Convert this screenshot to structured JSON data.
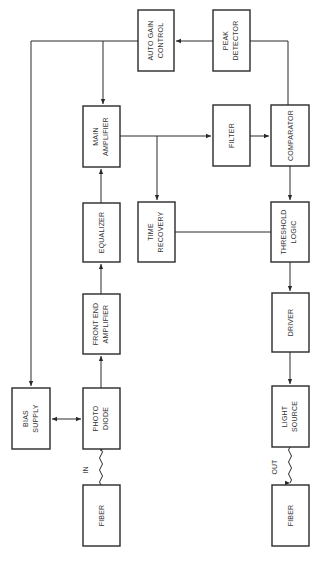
{
  "diagram": {
    "orientation": "rotated-90-ccw",
    "blocks": [
      {
        "id": "fiber_in",
        "lines": [
          "FIBER"
        ]
      },
      {
        "id": "photodiode",
        "lines": [
          "PHOTO",
          "DIODE"
        ]
      },
      {
        "id": "bias_supply",
        "lines": [
          "BIAS",
          "SUPPLY"
        ]
      },
      {
        "id": "front_end_amplifier",
        "lines": [
          "FRONT END",
          "AMPLIFIER"
        ]
      },
      {
        "id": "equalizer",
        "lines": [
          "EQUALIZER"
        ]
      },
      {
        "id": "main_amplifier",
        "lines": [
          "MAIN",
          "AMPLIFIER"
        ]
      },
      {
        "id": "auto_gain_control",
        "lines": [
          "AUTO GAIN",
          "CONTROL"
        ]
      },
      {
        "id": "time_recovery",
        "lines": [
          "TIME",
          "RECOVERY"
        ]
      },
      {
        "id": "filter",
        "lines": [
          "FILTER"
        ]
      },
      {
        "id": "peak_detector",
        "lines": [
          "PEAK",
          "DETECTOR"
        ]
      },
      {
        "id": "comparator",
        "lines": [
          "COMPARATOR"
        ]
      },
      {
        "id": "threshold_logic",
        "lines": [
          "THRESHOLD",
          "LOGIC"
        ]
      },
      {
        "id": "driver",
        "lines": [
          "DRIVER"
        ]
      },
      {
        "id": "light_source",
        "lines": [
          "LIGHT",
          "SOURCE"
        ]
      },
      {
        "id": "fiber_out",
        "lines": [
          "FIBER"
        ]
      }
    ],
    "io_labels": {
      "in": "IN",
      "out": "OUT"
    },
    "connections": [
      {
        "from": "fiber_in",
        "to": "photodiode",
        "style": "wavy",
        "label": "IN"
      },
      {
        "from": "bias_supply",
        "to": "photodiode",
        "style": "bidirectional"
      },
      {
        "from": "photodiode",
        "to": "front_end_amplifier"
      },
      {
        "from": "front_end_amplifier",
        "to": "equalizer"
      },
      {
        "from": "equalizer",
        "to": "main_amplifier"
      },
      {
        "from": "main_amplifier",
        "to": "filter"
      },
      {
        "from": "main_amplifier",
        "to": "time_recovery"
      },
      {
        "from": "filter",
        "to": "comparator"
      },
      {
        "from": "comparator",
        "to": "peak_detector"
      },
      {
        "from": "peak_detector",
        "to": "auto_gain_control"
      },
      {
        "from": "auto_gain_control",
        "to": "main_amplifier"
      },
      {
        "from": "auto_gain_control",
        "to": "bias_supply"
      },
      {
        "from": "comparator",
        "to": "threshold_logic"
      },
      {
        "from": "time_recovery",
        "to": "threshold_logic"
      },
      {
        "from": "threshold_logic",
        "to": "driver"
      },
      {
        "from": "driver",
        "to": "light_source"
      },
      {
        "from": "light_source",
        "to": "fiber_out",
        "style": "wavy",
        "label": "OUT"
      }
    ]
  }
}
